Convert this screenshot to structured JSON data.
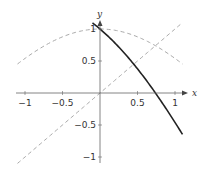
{
  "chart_data": {
    "type": "line",
    "title": "",
    "xlabel": "x",
    "ylabel": "y",
    "xlim": [
      -1.15,
      1.15
    ],
    "ylim": [
      -1.15,
      1.15
    ],
    "grid": false,
    "legend": null,
    "x_ticks": [
      -1,
      -0.5,
      0.5,
      1
    ],
    "x_tick_labels": [
      "−1",
      "−0.5",
      "0.5",
      "1"
    ],
    "y_ticks": [
      1,
      0.5,
      -0.5,
      -1
    ],
    "y_tick_labels": [
      "1",
      "0.5",
      "−0.5",
      "−1"
    ],
    "series": [
      {
        "name": "cos(x)",
        "style": "dashed",
        "color": "#aaaaaa",
        "x_range": [
          -1.1,
          1.1
        ]
      },
      {
        "name": "x",
        "style": "dashed",
        "color": "#aaaaaa",
        "x_range": [
          -1.1,
          1.1
        ]
      },
      {
        "name": "cos(x) - x",
        "style": "solid",
        "color": "#222222",
        "x_range": [
          -0.1,
          1.1
        ]
      }
    ]
  },
  "axes": {
    "x_label": "x",
    "y_label": "y"
  }
}
